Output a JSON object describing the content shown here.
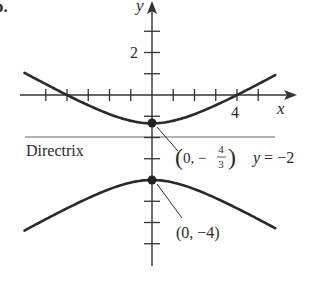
{
  "figure": {
    "problem_label": "b.",
    "axes": {
      "x_label": "x",
      "y_label": "y",
      "x_tick_label": "4",
      "y_tick_label": "2",
      "x_ticks": [
        -5,
        -4,
        -3,
        -2,
        -1,
        1,
        2,
        3,
        4,
        5
      ],
      "y_ticks": [
        3,
        2,
        1,
        -1,
        -2,
        -3,
        -4,
        -5,
        -6,
        -7
      ]
    },
    "hyperbola": {
      "center": [
        0,
        -2.6667
      ],
      "a": 1.3333,
      "b_squared": 5.3333,
      "orientation": "vertical",
      "x_range": [
        -6.0,
        5.8
      ]
    },
    "directrix": {
      "label": "Directrix",
      "equation": "y = −2",
      "y": -2,
      "color": "#b3b3b3"
    },
    "points": [
      {
        "name": "upper-vertex",
        "coords": [
          0,
          -1.3333
        ],
        "label_prefix": "(0, −",
        "label_num": "4",
        "label_den": "3",
        "label_suffix": ")"
      },
      {
        "name": "lower-vertex",
        "coords": [
          0,
          -4
        ],
        "label": "(0, −4)"
      }
    ],
    "colors": {
      "curve": "#2a2a2a",
      "axis": "#333333"
    }
  }
}
